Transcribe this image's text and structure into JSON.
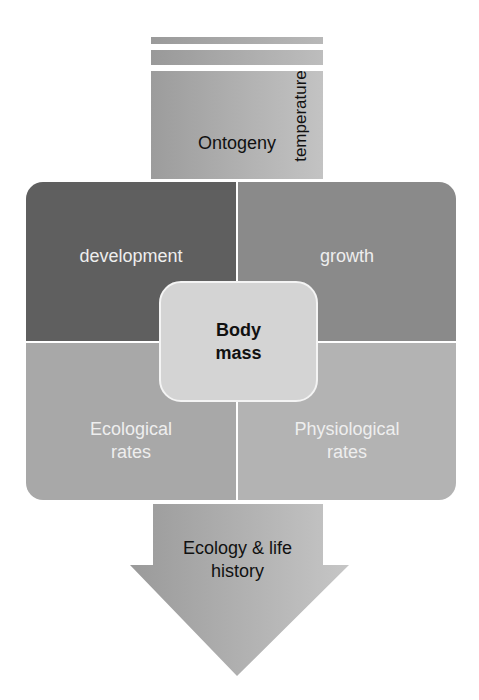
{
  "diagram": {
    "top_input": {
      "label": "Ontogeny",
      "side_label": "temperature"
    },
    "quadrants": [
      {
        "id": "development",
        "label": "development",
        "color": "#5f5f5f"
      },
      {
        "id": "growth",
        "label": "growth",
        "color": "#8a8a8a"
      },
      {
        "id": "ecological-rates",
        "label": "Ecological rates",
        "line1": "Ecological",
        "line2": "rates",
        "color": "#a8a8a8"
      },
      {
        "id": "physiological-rates",
        "label": "Physiological rates",
        "line1": "Physiological",
        "line2": "rates",
        "color": "#b3b3b3"
      }
    ],
    "center": {
      "line1": "Body",
      "line2": "mass",
      "color": "#d4d4d4"
    },
    "output_arrow": {
      "line1": "Ecology & life",
      "line2": "history"
    }
  }
}
